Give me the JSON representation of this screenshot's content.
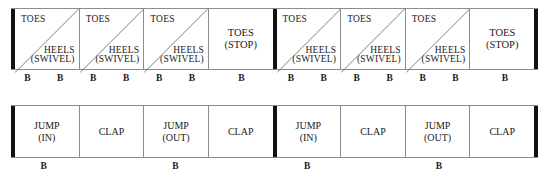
{
  "diagram": {
    "type": "dance-step-notation-chart",
    "beat_symbol": "B",
    "rows": [
      {
        "id": "row-top",
        "name": "toes-heels-swivel-row",
        "halves": [
          {
            "id": "top-half-1",
            "cells": [
              {
                "style": "split",
                "upper": "TOES",
                "lower_line1": "HEELS",
                "lower_line2": "(SWIVEL)",
                "beats": [
                  "B",
                  "B"
                ]
              },
              {
                "style": "split",
                "upper": "TOES",
                "lower_line1": "HEELS",
                "lower_line2": "(SWIVEL)",
                "beats": [
                  "B",
                  "B"
                ]
              },
              {
                "style": "split",
                "upper": "TOES",
                "lower_line1": "HEELS",
                "lower_line2": "(SWIVEL)",
                "beats": [
                  "B",
                  "B"
                ]
              },
              {
                "style": "center",
                "line1": "TOES",
                "line2": "(STOP)",
                "beats": [
                  "B"
                ]
              }
            ]
          },
          {
            "id": "top-half-2",
            "cells": [
              {
                "style": "split",
                "upper": "TOES",
                "lower_line1": "HEELS",
                "lower_line2": "(SWIVEL)",
                "beats": [
                  "B",
                  "B"
                ]
              },
              {
                "style": "split",
                "upper": "TOES",
                "lower_line1": "HEELS",
                "lower_line2": "(SWIVEL)",
                "beats": [
                  "B",
                  "B"
                ]
              },
              {
                "style": "split",
                "upper": "TOES",
                "lower_line1": "HEELS",
                "lower_line2": "(SWIVEL)",
                "beats": [
                  "B",
                  "B"
                ]
              },
              {
                "style": "center",
                "line1": "TOES",
                "line2": "(STOP)",
                "beats": [
                  "B"
                ]
              }
            ]
          }
        ]
      },
      {
        "id": "row-bottom",
        "name": "jump-clap-row",
        "halves": [
          {
            "id": "bottom-half-1",
            "cells": [
              {
                "style": "center",
                "line1": "JUMP",
                "line2": "(IN)",
                "beats": [
                  "B"
                ]
              },
              {
                "style": "center",
                "line1": "CLAP",
                "line2": "",
                "beats": []
              },
              {
                "style": "center",
                "line1": "JUMP",
                "line2": "(OUT)",
                "beats": [
                  "B"
                ]
              },
              {
                "style": "center",
                "line1": "CLAP",
                "line2": "",
                "beats": []
              }
            ]
          },
          {
            "id": "bottom-half-2",
            "cells": [
              {
                "style": "center",
                "line1": "JUMP",
                "line2": "(IN)",
                "beats": [
                  "B"
                ]
              },
              {
                "style": "center",
                "line1": "CLAP",
                "line2": "",
                "beats": []
              },
              {
                "style": "center",
                "line1": "JUMP",
                "line2": "(OUT)",
                "beats": [
                  "B"
                ]
              },
              {
                "style": "center",
                "line1": "CLAP",
                "line2": "",
                "beats": []
              }
            ]
          }
        ]
      }
    ],
    "colors": {
      "background": "#ffffff",
      "text": "#1a1a1a",
      "thin_rule": "#8d8d8d",
      "bar_line": "#111111",
      "diagonal": "#4a4a4a"
    }
  }
}
